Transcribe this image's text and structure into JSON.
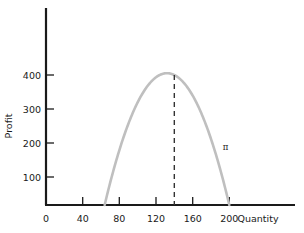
{
  "chart_data": {
    "type": "line",
    "title": "",
    "xlabel": "Quantity",
    "ylabel": "Profit",
    "xlim": [
      0,
      240
    ],
    "ylim": [
      0,
      470
    ],
    "grid": false,
    "legend": null,
    "x_ticks": [
      0,
      40,
      80,
      120,
      160,
      200
    ],
    "y_ticks": [
      100,
      200,
      300,
      400
    ],
    "series": [
      {
        "name": "π",
        "label": "π",
        "color": "#bfbfbf",
        "kind": "parabola",
        "roots": [
          64,
          200
        ],
        "vertex_x": 140,
        "vertex_y": 400,
        "x": [
          64,
          72,
          80,
          88,
          96,
          104,
          112,
          120,
          128,
          136,
          140,
          144,
          152,
          160,
          168,
          176,
          184,
          192,
          200
        ],
        "y": [
          0,
          70,
          132,
          188,
          236,
          277,
          311,
          338,
          358,
          371,
          400,
          373,
          362,
          340,
          311,
          274,
          231,
          180,
          0
        ]
      }
    ],
    "annotations": [
      {
        "name": "max-profit-dashed-line",
        "kind": "vertical-dashed",
        "x": 140,
        "y_from": 0,
        "y_to": 400,
        "color": "#333333"
      },
      {
        "name": "profit-curve-label",
        "kind": "text",
        "text": "π",
        "x": 196,
        "y": 168
      }
    ]
  },
  "axes": {
    "y_axis_name": "Profit",
    "x_axis_name": "Quantity",
    "y_tick_labels": [
      "400",
      "300",
      "200",
      "100"
    ],
    "x_tick_labels": [
      "0",
      "40",
      "80",
      "120",
      "160",
      "200"
    ]
  },
  "colors": {
    "axis": "#1a1a1a",
    "curve": "#bfbfbf",
    "dashed": "#333333",
    "text": "#1a1a1a",
    "background": "#ffffff"
  }
}
